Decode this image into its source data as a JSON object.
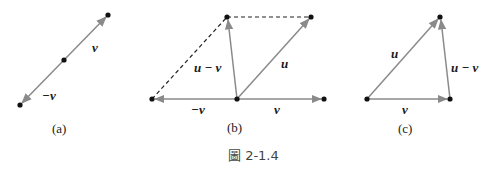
{
  "figure": {
    "caption": "圖 2-1.4",
    "panels": [
      {
        "id": "a",
        "label": "(a)",
        "vectors": [
          {
            "name": "v",
            "label": "v"
          },
          {
            "name": "neg-v",
            "label": "−v"
          }
        ]
      },
      {
        "id": "b",
        "label": "(b)",
        "vectors": [
          {
            "name": "u-minus-v",
            "label": "u − v"
          },
          {
            "name": "u",
            "label": "u"
          },
          {
            "name": "neg-v",
            "label": "−v"
          },
          {
            "name": "v",
            "label": "v"
          }
        ]
      },
      {
        "id": "c",
        "label": "(c)",
        "vectors": [
          {
            "name": "u",
            "label": "u"
          },
          {
            "name": "u-minus-v",
            "label": "u − v"
          },
          {
            "name": "v",
            "label": "v"
          }
        ]
      }
    ]
  },
  "colors": {
    "vector": "#8a8a8a",
    "point": "#111111",
    "dashed": "#222222"
  }
}
